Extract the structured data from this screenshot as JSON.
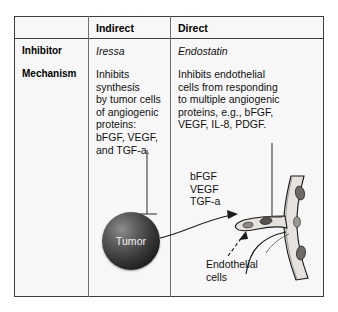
{
  "table": {
    "column_headers": [
      "",
      "Indirect",
      "Direct"
    ],
    "rows": [
      {
        "label": "Inhibitor",
        "indirect": "Iressa",
        "direct": "Endostatin"
      },
      {
        "label": "Mechanism",
        "indirect": "Inhibits synthesis\nby tumor cells\nof angiogenic\nproteins:\nbFGF, VEGF,\nand TGF-a.",
        "direct": "Inhibits endothelial\ncells from responding\nto multiple angiogenic\nproteins, e.g., bFGF,\nVEGF, IL-8, PDGF."
      }
    ]
  },
  "diagram": {
    "tumor_label": "Tumor",
    "growth_factors": "bFGF\nVEGF\nTGF-a",
    "endothelial_label": "Endothelial\ncells",
    "icons": {
      "inhibition_bar_left": "t-bar-inhibition-icon",
      "inhibition_bar_right": "t-bar-inhibition-icon",
      "secretion_arrow": "curved-arrow-icon",
      "pointer_arrow": "dashed-arrow-icon",
      "vessel": "blood-vessel-icon",
      "tumor": "tumor-sphere-icon"
    }
  },
  "colors": {
    "frame_border": "#3d3d3d",
    "divider": "#6f6f6f",
    "panel_background": "#f7f7f7",
    "page_background": "#ffffff",
    "text": "#111111",
    "tumor_text": "#ffffff",
    "vessel_fill": "#e3e0db",
    "vessel_stroke": "#1a1a1a"
  }
}
